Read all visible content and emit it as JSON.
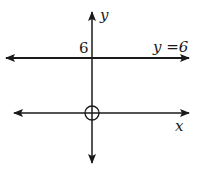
{
  "diagram": {
    "type": "coordinate-graph",
    "axes": {
      "x_label": "x",
      "y_label": "y"
    },
    "tick_labels": {
      "y_intercept": "6"
    },
    "line_label": "y =6",
    "origin_marker": "open-circle",
    "colors": {
      "line": "#1a1a1a",
      "background": "#ffffff"
    }
  }
}
